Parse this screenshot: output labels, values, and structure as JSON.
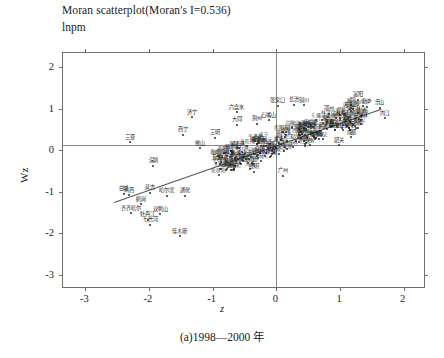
{
  "figure": {
    "title": "Moran scatterplot(Moran's I=0.536)",
    "subtitle": "lnpm",
    "caption": "(a)1998—2000 年",
    "moran_i": 0.536
  },
  "chart_data": {
    "type": "scatter",
    "title": "Moran scatterplot(Moran's I=0.536)",
    "subtitle": "lnpm",
    "xlabel": "z",
    "ylabel": "Wz",
    "xlim": [
      -3.35,
      2.35
    ],
    "ylim": [
      -3.35,
      2.35
    ],
    "xticks": [
      "-3",
      "-2",
      "-1",
      "0",
      "1",
      "2"
    ],
    "xtick_values": [
      -3,
      -2,
      -1,
      0,
      1,
      2
    ],
    "yticks": [
      "2",
      "1",
      "0",
      "-1",
      "-2",
      "-3"
    ],
    "ytick_values": [
      2,
      1,
      0,
      -1,
      -2,
      -3
    ],
    "grid": false,
    "legend": null,
    "reference_lines": {
      "horizontal_y": 0.13,
      "vertical_x": 0.0
    },
    "fit_line": {
      "slope": 0.536,
      "intercept": 0.13,
      "x_start": -2.55,
      "x_end": 1.65
    },
    "points": [
      {
        "label": "三亚",
        "x": -2.3,
        "y": 0.2
      },
      {
        "label": "深圳",
        "x": -1.93,
        "y": -0.37
      },
      {
        "label": "济宁",
        "x": -1.33,
        "y": 0.8
      },
      {
        "label": "西宁",
        "x": -1.47,
        "y": 0.38
      },
      {
        "label": "六盘水",
        "x": -0.62,
        "y": 0.92
      },
      {
        "label": "大同",
        "x": -0.62,
        "y": 0.62
      },
      {
        "label": "荆州",
        "x": -0.3,
        "y": 0.64
      },
      {
        "label": "石嘴山",
        "x": -0.12,
        "y": 0.72
      },
      {
        "label": "张家口",
        "x": 0.02,
        "y": 1.08
      },
      {
        "label": "长治",
        "x": 0.28,
        "y": 1.1
      },
      {
        "label": "铜川",
        "x": 0.44,
        "y": 1.09
      },
      {
        "label": "鄂州",
        "x": 0.82,
        "y": 0.88
      },
      {
        "label": "富阳",
        "x": 1.28,
        "y": 1.22
      },
      {
        "label": "威海",
        "x": 1.18,
        "y": 1.09
      },
      {
        "label": "新乡",
        "x": 1.42,
        "y": 1.05
      },
      {
        "label": "乐山",
        "x": 1.62,
        "y": 1.03
      },
      {
        "label": "内江",
        "x": 1.7,
        "y": 0.78
      },
      {
        "label": "洛阳",
        "x": 1.28,
        "y": 0.55
      },
      {
        "label": "成都",
        "x": 1.18,
        "y": 0.32
      },
      {
        "label": "韶关",
        "x": 0.98,
        "y": 0.12
      },
      {
        "label": "三明",
        "x": -0.97,
        "y": 0.3
      },
      {
        "label": "佛山",
        "x": -1.2,
        "y": 0.05
      },
      {
        "label": "玉溪",
        "x": -0.95,
        "y": -0.3
      },
      {
        "label": "广州",
        "x": 0.1,
        "y": -0.62
      },
      {
        "label": "昆明",
        "x": -0.35,
        "y": -0.52
      },
      {
        "label": "乌海",
        "x": -0.42,
        "y": -0.46
      },
      {
        "label": "茂名",
        "x": -0.66,
        "y": -0.44
      },
      {
        "label": "哈尔滨",
        "x": -1.72,
        "y": -1.1
      },
      {
        "label": "齐齐哈尔",
        "x": -2.28,
        "y": -1.52
      },
      {
        "label": "鹤岗",
        "x": -2.13,
        "y": -1.3
      },
      {
        "label": "双鸭山",
        "x": -1.82,
        "y": -1.55
      },
      {
        "label": "牡丹江",
        "x": -2.02,
        "y": -1.68
      },
      {
        "label": "七台河",
        "x": -1.98,
        "y": -1.8
      },
      {
        "label": "佳木斯",
        "x": -1.52,
        "y": -2.08
      },
      {
        "label": "鸡西",
        "x": -2.32,
        "y": -1.08
      },
      {
        "label": "延吉",
        "x": -1.98,
        "y": -1.02
      },
      {
        "label": "通化",
        "x": -1.43,
        "y": -1.1
      },
      {
        "label": "白城",
        "x": -2.4,
        "y": -1.05
      }
    ],
    "extra_cluster": {
      "description": "dense overlapping unreadable city labels along the regression trend from z≈-0.9 to z≈1.4",
      "count": 180
    }
  }
}
